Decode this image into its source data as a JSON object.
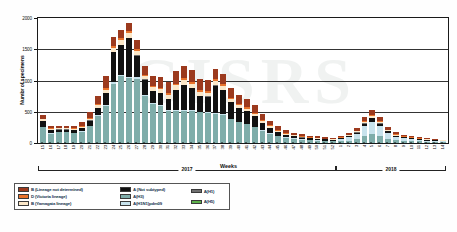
{
  "axes": {
    "y_title": "Numbr of specimens",
    "y_ticks": [
      "0",
      "500",
      "1000",
      "1500",
      "2000"
    ],
    "x_title": "Weeks"
  },
  "watermark": "GISRS",
  "year_bands": [
    {
      "label": "2017",
      "start_index": 0,
      "end_index": 37
    },
    {
      "label": "2018",
      "start_index": 38,
      "end_index": 51
    }
  ],
  "legend": {
    "columns": [
      {
        "items": [
          {
            "label": "B (Lineage not determined)",
            "color": "#9c3a1e"
          },
          {
            "label": "D (Victoria lineage)",
            "color": "#e8732c"
          },
          {
            "label": "B (Yamagata lineage)",
            "color": "#fbe7c8"
          }
        ]
      },
      {
        "items": [
          {
            "label": "A (Not subtyped)",
            "color": "#111111"
          },
          {
            "label": "A(H3)",
            "color": "#7fadaa"
          },
          {
            "label": "A(H1N1)pdm09",
            "color": "#c7e2ec"
          }
        ]
      },
      {
        "items": [
          {
            "label": "A(H1)",
            "color": "#6f6f6f"
          },
          {
            "label": "A(H5)",
            "color": "#5cb14a"
          }
        ]
      }
    ]
  },
  "chart_data": {
    "type": "bar",
    "subtype": "stacked",
    "title": "",
    "xlabel": "Weeks",
    "ylabel": "Numbr of specimens",
    "ylim": [
      0,
      2000
    ],
    "yticks": [
      0,
      500,
      1000,
      1500,
      2000
    ],
    "grid": true,
    "legend_position": "bottom-left",
    "categories": [
      "15",
      "16",
      "17",
      "18",
      "19",
      "20",
      "21",
      "22",
      "23",
      "24",
      "25",
      "26",
      "27",
      "28",
      "29",
      "30",
      "31",
      "32",
      "33",
      "34",
      "35",
      "36",
      "37",
      "38",
      "39",
      "40",
      "41",
      "42",
      "43",
      "44",
      "45",
      "46",
      "47",
      "48",
      "49",
      "50",
      "51",
      "52",
      "1",
      "2",
      "3",
      "4",
      "5",
      "6",
      "7",
      "8",
      "9",
      "10",
      "11",
      "12",
      "13",
      "14"
    ],
    "category_years": [
      "2017",
      "2017",
      "2017",
      "2017",
      "2017",
      "2017",
      "2017",
      "2017",
      "2017",
      "2017",
      "2017",
      "2017",
      "2017",
      "2017",
      "2017",
      "2017",
      "2017",
      "2017",
      "2017",
      "2017",
      "2017",
      "2017",
      "2017",
      "2017",
      "2017",
      "2017",
      "2017",
      "2017",
      "2017",
      "2017",
      "2017",
      "2017",
      "2017",
      "2017",
      "2017",
      "2017",
      "2017",
      "2017",
      "2018",
      "2018",
      "2018",
      "2018",
      "2018",
      "2018",
      "2018",
      "2018",
      "2018",
      "2018",
      "2018",
      "2018",
      "2018",
      "2018"
    ],
    "series": [
      {
        "name": "A(H3)",
        "color": "#7fadaa",
        "values": [
          250,
          150,
          170,
          170,
          160,
          180,
          270,
          430,
          600,
          950,
          1070,
          1040,
          1030,
          760,
          620,
          590,
          520,
          510,
          520,
          510,
          490,
          480,
          470,
          450,
          380,
          330,
          300,
          250,
          200,
          150,
          110,
          85,
          70,
          55,
          45,
          40,
          35,
          30,
          30,
          40,
          60,
          120,
          150,
          120,
          70,
          45,
          35,
          30,
          25,
          20,
          18,
          15
        ]
      },
      {
        "name": "A(H1N1)pdm09",
        "color": "#c7e2ec",
        "values": [
          8,
          5,
          5,
          5,
          5,
          6,
          8,
          12,
          15,
          20,
          22,
          22,
          20,
          16,
          14,
          13,
          12,
          12,
          12,
          12,
          11,
          11,
          10,
          10,
          9,
          8,
          8,
          7,
          6,
          5,
          5,
          4,
          4,
          4,
          4,
          4,
          4,
          4,
          30,
          50,
          80,
          150,
          190,
          150,
          90,
          55,
          40,
          32,
          25,
          20,
          16,
          12
        ]
      },
      {
        "name": "A (Not subtyped)",
        "color": "#111111",
        "values": [
          95,
          55,
          40,
          40,
          45,
          55,
          80,
          120,
          180,
          480,
          470,
          620,
          350,
          240,
          200,
          190,
          175,
          330,
          400,
          360,
          250,
          250,
          440,
          390,
          260,
          220,
          200,
          170,
          120,
          90,
          60,
          40,
          32,
          28,
          24,
          20,
          18,
          16,
          14,
          18,
          26,
          40,
          55,
          40,
          26,
          18,
          14,
          12,
          10,
          9,
          8,
          7
        ]
      },
      {
        "name": "A(H1)",
        "color": "#6f6f6f",
        "values": [
          3,
          2,
          2,
          2,
          2,
          2,
          3,
          4,
          5,
          6,
          6,
          6,
          6,
          5,
          5,
          4,
          4,
          4,
          4,
          4,
          4,
          4,
          4,
          4,
          3,
          3,
          3,
          3,
          2,
          2,
          2,
          2,
          2,
          2,
          2,
          2,
          2,
          2,
          2,
          2,
          3,
          4,
          5,
          4,
          3,
          2,
          2,
          2,
          2,
          2,
          2,
          2
        ]
      },
      {
        "name": "A(H5)",
        "color": "#5cb14a",
        "values": [
          0,
          0,
          0,
          0,
          0,
          0,
          0,
          0,
          0,
          0,
          0,
          0,
          0,
          0,
          0,
          0,
          0,
          0,
          0,
          0,
          0,
          0,
          0,
          0,
          0,
          0,
          0,
          0,
          0,
          0,
          0,
          0,
          0,
          0,
          0,
          0,
          0,
          0,
          0,
          0,
          0,
          0,
          0,
          0,
          0,
          0,
          0,
          0,
          0,
          0,
          0,
          0
        ]
      },
      {
        "name": "B (Yamagata lineage)",
        "color": "#fbe7c8",
        "values": [
          22,
          18,
          16,
          16,
          16,
          20,
          28,
          40,
          55,
          70,
          75,
          75,
          70,
          50,
          55,
          60,
          60,
          65,
          70,
          65,
          60,
          60,
          65,
          60,
          50,
          45,
          40,
          35,
          28,
          24,
          20,
          16,
          14,
          12,
          11,
          10,
          9,
          8,
          10,
          14,
          18,
          26,
          32,
          26,
          18,
          14,
          11,
          9,
          8,
          7,
          6,
          5
        ]
      },
      {
        "name": "B (Victoria lineage)",
        "color": "#e8732c",
        "values": [
          10,
          8,
          7,
          7,
          7,
          9,
          12,
          18,
          24,
          30,
          32,
          32,
          30,
          22,
          24,
          26,
          26,
          28,
          30,
          28,
          26,
          26,
          28,
          26,
          22,
          20,
          18,
          16,
          13,
          11,
          9,
          8,
          7,
          6,
          5,
          5,
          4,
          4,
          5,
          6,
          8,
          12,
          15,
          12,
          8,
          6,
          5,
          4,
          4,
          3,
          3,
          3
        ]
      },
      {
        "name": "B (Lineage not determined)",
        "color": "#9c3a1e",
        "values": [
          55,
          40,
          35,
          35,
          40,
          60,
          90,
          130,
          190,
          145,
          135,
          120,
          135,
          145,
          155,
          175,
          185,
          200,
          190,
          190,
          190,
          185,
          170,
          160,
          150,
          140,
          130,
          120,
          95,
          78,
          60,
          46,
          38,
          32,
          28,
          24,
          22,
          20,
          24,
          34,
          48,
          70,
          88,
          70,
          46,
          32,
          26,
          21,
          18,
          15,
          13,
          11
        ]
      }
    ]
  }
}
